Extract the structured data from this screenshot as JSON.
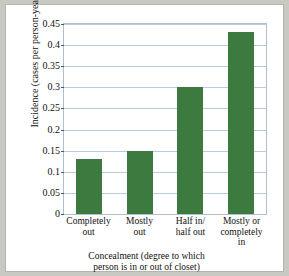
{
  "chart_data": {
    "type": "bar",
    "title": "",
    "categories": [
      "Completely out",
      "Mostly out",
      "Half in/ half out",
      "Mostly or completely in"
    ],
    "category_lines": [
      [
        "Completely",
        "out"
      ],
      [
        "Mostly",
        "out"
      ],
      [
        "Half in/",
        "half out"
      ],
      [
        "Mostly or",
        "completely",
        "in"
      ]
    ],
    "values": [
      0.13,
      0.15,
      0.3,
      0.43
    ],
    "xlabel": "Concealment (degree to which person is in or out of closet)",
    "xlabel_lines": [
      "Concealment (degree to which",
      "person is in or out of closet)"
    ],
    "ylabel": "Incidence (cases per person-year)",
    "ylim": [
      0,
      0.45
    ],
    "yticks": [
      0,
      0.05,
      0.1,
      0.15,
      0.2,
      0.25,
      0.3,
      0.35,
      0.4,
      0.45
    ],
    "ytick_labels": [
      "0",
      "0.05",
      "0.1",
      "0.15",
      "0.2",
      "0.25",
      "0.3",
      "0.35",
      "0.4",
      "0.45"
    ],
    "grid": true,
    "legend": null,
    "colors": {
      "bar": "#3d7a40",
      "gridline": "#b8cce0",
      "plot_border": "#aebfd2",
      "figure_background": "#ffffff",
      "page_background": "#c9c9c4",
      "text": "#111111"
    }
  }
}
